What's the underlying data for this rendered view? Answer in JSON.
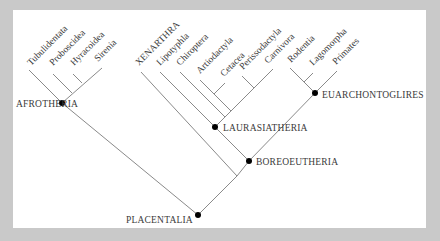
{
  "figure": {
    "type": "phylogenetic-tree",
    "colors": {
      "background": "#c9c9c9",
      "panel": "#ffffff",
      "branch": "#8a8a8a",
      "node": "#000000",
      "text": "#3a3a3a"
    },
    "leaves": [
      {
        "label": "Tubulidentata"
      },
      {
        "label": "Proboscidea"
      },
      {
        "label": "Hyracoidea"
      },
      {
        "label": "Sirenia"
      },
      {
        "label": "XENARTHRA"
      },
      {
        "label": "Lipotyphla"
      },
      {
        "label": "Chiroptera"
      },
      {
        "label": "Artiodactyla"
      },
      {
        "label": "Cetacea"
      },
      {
        "label": "Perissodactyla"
      },
      {
        "label": "Carnivora"
      },
      {
        "label": "Rodentia"
      },
      {
        "label": "Lagomorpha"
      },
      {
        "label": "Primates"
      }
    ],
    "clades": {
      "afrotheria": "AFROTHERIA",
      "laurasiatheria": "LAURASIATHERIA",
      "euarchontoglires": "EUARCHONTOGLIRES",
      "boreoeutheria": "BOREOEUTHERIA",
      "placentalia": "PLACENTALIA"
    },
    "topology": "(((Tubulidentata,Proboscidea,Hyracoidea,Sirenia)AFROTHERIA,(XENARTHRA,(((Lipotyphla,Chiroptera,(Artiodactyla,Cetacea),(Perissodactyla,Carnivora))LAURASIATHERIA,((Rodentia,Lagomorpha),Primates)EUARCHONTOGLIRES)BOREOEUTHERIA)))PLACENTALIA)"
  }
}
